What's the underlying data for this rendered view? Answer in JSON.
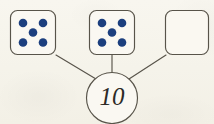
{
  "worksheet": {
    "type": "number-bond",
    "background_color": "#f7f5ee",
    "ink_color": "#58544a",
    "pip_color": "#1c3f7e",
    "text_color": "#2c2a26",
    "sum": {
      "label": "10",
      "shape": "circle"
    },
    "parts": [
      {
        "id": "part-1",
        "kind": "die",
        "pip_count": 5,
        "pip_pattern": "quincunx",
        "filled": true,
        "value_label": "5"
      },
      {
        "id": "part-2",
        "kind": "die",
        "pip_count": 5,
        "pip_pattern": "quincunx",
        "filled": true,
        "value_label": "5"
      },
      {
        "id": "part-3",
        "kind": "die",
        "pip_count": 0,
        "pip_pattern": "none",
        "filled": false,
        "value_label": ""
      }
    ],
    "connectors": [
      {
        "id": "connector-left",
        "from": "part-1",
        "to": "sum"
      },
      {
        "id": "connector-middle",
        "from": "part-2",
        "to": "sum"
      },
      {
        "id": "connector-right",
        "from": "part-3",
        "to": "sum"
      }
    ]
  }
}
